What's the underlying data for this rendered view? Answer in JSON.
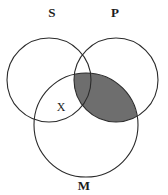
{
  "figure": {
    "type": "venn-diagram-3-circle",
    "background_color": "#ffffff",
    "stroke_color": "#2b2b2b",
    "stroke_width": 1.1,
    "shade_color": "#6e6e6e",
    "label_color": "#1c1c1c"
  },
  "circles": [
    {
      "id": "S",
      "label": "S",
      "cx": 49,
      "cy": 80,
      "r": 42
    },
    {
      "id": "P",
      "label": "P",
      "cx": 116,
      "cy": 80,
      "r": 42
    },
    {
      "id": "M",
      "label": "M",
      "cx": 86,
      "cy": 125,
      "r": 52
    }
  ],
  "labels": {
    "subject": "S",
    "predicate": "P",
    "middle": "M"
  },
  "label_positions": {
    "subject": {
      "x": 52,
      "y": 14
    },
    "predicate": {
      "x": 115,
      "y": 14
    },
    "middle": {
      "x": 84,
      "y": 187
    }
  },
  "marks": [
    {
      "symbol": "X",
      "region": "S-and-M-not-P",
      "x": 61,
      "y": 108,
      "meaning": "existential-marker"
    }
  ],
  "shaded_regions": [
    {
      "region": "P-and-M",
      "color": "#6e6e6e",
      "meaning": "empty-region"
    }
  ]
}
